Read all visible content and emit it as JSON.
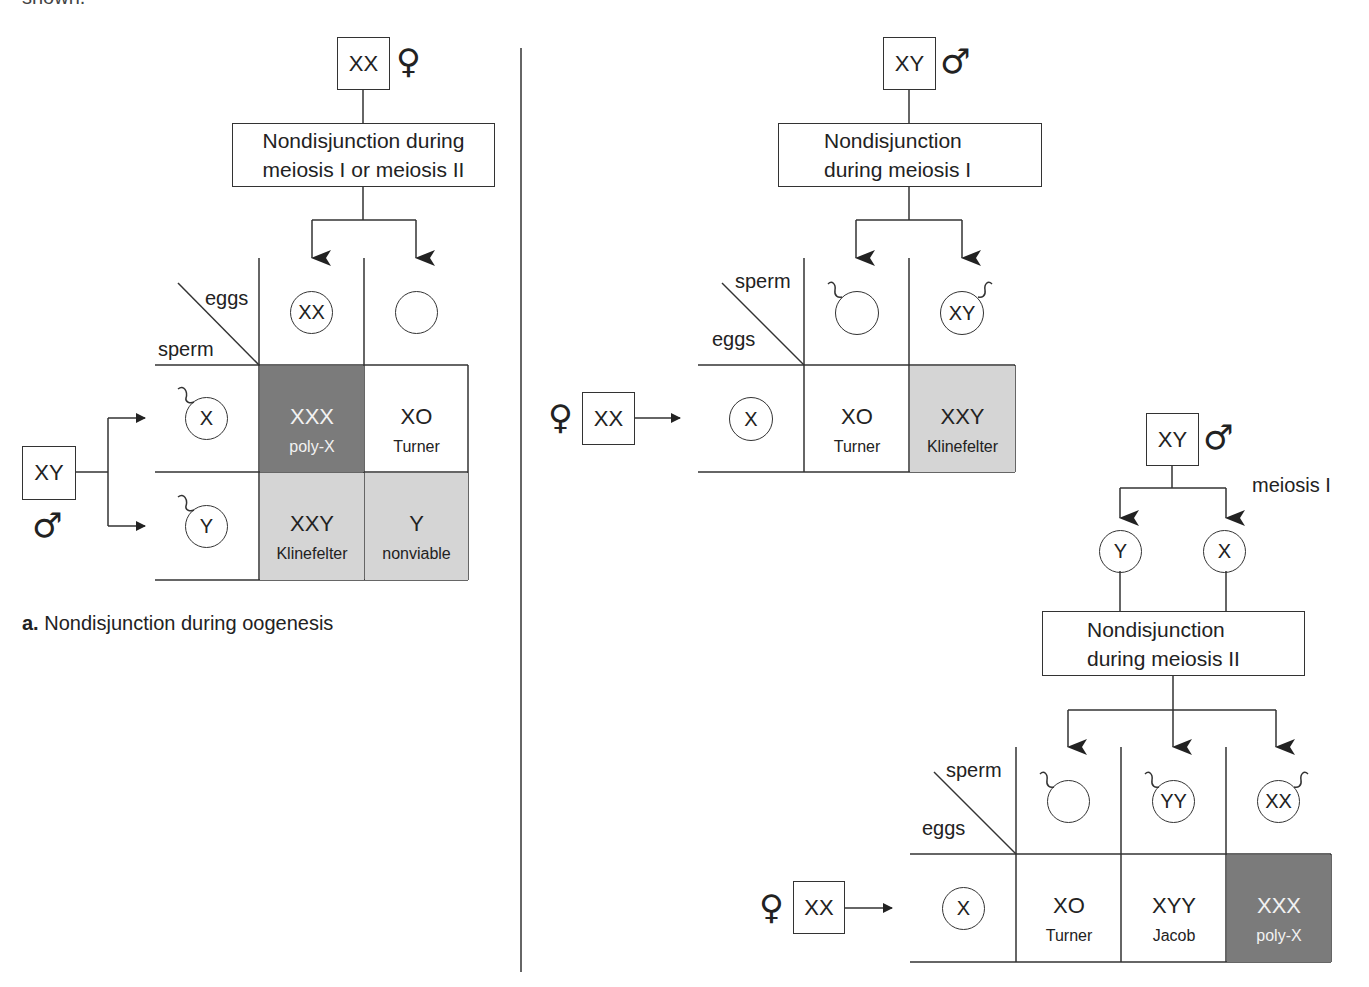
{
  "clipped_top_text": "shown.",
  "panel_a": {
    "caption_letter": "a.",
    "caption_text": "Nondisjunction during oogenesis",
    "mother": {
      "genotype": "XX",
      "symbol": "♀"
    },
    "process": {
      "line1": "Nondisjunction during",
      "line2": "meiosis I or meiosis II"
    },
    "grid": {
      "corner_top": "eggs",
      "corner_bottom": "sperm",
      "col_gametes": [
        "XX",
        ""
      ],
      "row_gametes": [
        "X",
        "Y"
      ],
      "cells": [
        [
          {
            "karyotype": "XXX",
            "syndrome": "poly-X",
            "shade": "dark"
          },
          {
            "karyotype": "XO",
            "syndrome": "Turner",
            "shade": "none"
          }
        ],
        [
          {
            "karyotype": "XXY",
            "syndrome": "Klinefelter",
            "shade": "light"
          },
          {
            "karyotype": "Y",
            "syndrome": "nonviable",
            "shade": "light"
          }
        ]
      ]
    },
    "father": {
      "genotype": "XY",
      "symbol": "♂"
    }
  },
  "panel_b_meiosis1": {
    "father": {
      "genotype": "XY",
      "symbol": "♂"
    },
    "process": {
      "line1": "Nondisjunction",
      "line2": "during meiosis I"
    },
    "grid": {
      "corner_top": "sperm",
      "corner_bottom": "eggs",
      "col_gametes": [
        "",
        "XY"
      ],
      "row_gametes": [
        "X"
      ],
      "cells": [
        [
          {
            "karyotype": "XO",
            "syndrome": "Turner",
            "shade": "none"
          },
          {
            "karyotype": "XXY",
            "syndrome": "Klinefelter",
            "shade": "light"
          }
        ]
      ]
    },
    "mother": {
      "genotype": "XX",
      "symbol": "♀"
    }
  },
  "panel_b_meiosis2": {
    "father": {
      "genotype": "XY",
      "symbol": "♂"
    },
    "meiosis_label": "meiosis I",
    "products": [
      "Y",
      "X"
    ],
    "process": {
      "line1": "Nondisjunction",
      "line2": "during meiosis II"
    },
    "grid": {
      "corner_top": "sperm",
      "corner_bottom": "eggs",
      "col_gametes": [
        "",
        "YY",
        "XX"
      ],
      "row_gametes": [
        "X"
      ],
      "cells": [
        [
          {
            "karyotype": "XO",
            "syndrome": "Turner",
            "shade": "none"
          },
          {
            "karyotype": "XYY",
            "syndrome": "Jacob",
            "shade": "none"
          },
          {
            "karyotype": "XXX",
            "syndrome": "poly-X",
            "shade": "dark"
          }
        ]
      ]
    },
    "mother": {
      "genotype": "XX",
      "symbol": "♀"
    }
  },
  "colors": {
    "line": "#333333",
    "dark_shade": "#7b7b7b",
    "light_shade": "#d5d5d5",
    "background": "#ffffff"
  }
}
